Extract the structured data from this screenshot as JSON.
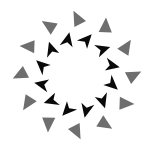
{
  "figure": {
    "background_color": "#ffffff",
    "width": 153,
    "height": 146,
    "center": {
      "x": 77,
      "y": 75
    },
    "frame": {
      "top_rule_color": "#8d8d8d",
      "bottom_rule_color": "#e2e2e2",
      "left_rule_color": "#b4b4b4",
      "right_rule_color": "#6f6f6f"
    }
  },
  "rings": [
    {
      "id": "outer-ring",
      "name": "outer ring of gray triangles",
      "element_count": 12,
      "element_shape": "triangle",
      "fill_color": "#6e6e6e",
      "radius": 57,
      "element_size": 13,
      "tilt_degrees": -28,
      "start_angle_degrees": -90,
      "elements": [
        {
          "index": 0,
          "angle": -90,
          "cx": 77,
          "cy": 18
        },
        {
          "index": 1,
          "angle": -60,
          "cx": 105.5,
          "cy": 25.5
        },
        {
          "index": 2,
          "angle": -30,
          "cx": 126.4,
          "cy": 46.5
        },
        {
          "index": 3,
          "angle": 0,
          "cx": 134,
          "cy": 75
        },
        {
          "index": 4,
          "angle": 30,
          "cx": 126.4,
          "cy": 103.5
        },
        {
          "index": 5,
          "angle": 60,
          "cx": 105.5,
          "cy": 124.4
        },
        {
          "index": 6,
          "angle": 90,
          "cx": 77,
          "cy": 132
        },
        {
          "index": 7,
          "angle": 120,
          "cx": 48.5,
          "cy": 124.4
        },
        {
          "index": 8,
          "angle": 150,
          "cx": 27.6,
          "cy": 103.5
        },
        {
          "index": 9,
          "angle": 180,
          "cx": 20,
          "cy": 75
        },
        {
          "index": 10,
          "angle": 210,
          "cx": 27.6,
          "cy": 46.5
        },
        {
          "index": 11,
          "angle": 240,
          "cx": 48.5,
          "cy": 25.5
        }
      ]
    },
    {
      "id": "inner-ring",
      "name": "inner ring of black notched arrow shapes",
      "element_count": 12,
      "element_shape": "notched-arrow",
      "fill_color": "#0a0a0a",
      "radius": 36,
      "element_size": 13,
      "tilt_degrees": 32,
      "start_angle_degrees": -75,
      "elements": [
        {
          "index": 0,
          "angle": -75,
          "cx": 86.3,
          "cy": 40.2
        },
        {
          "index": 1,
          "angle": -45,
          "cx": 102.5,
          "cy": 49.5
        },
        {
          "index": 2,
          "angle": -15,
          "cx": 111.8,
          "cy": 65.7
        },
        {
          "index": 3,
          "angle": 15,
          "cx": 111.8,
          "cy": 84.3
        },
        {
          "index": 4,
          "angle": 45,
          "cx": 102.5,
          "cy": 100.5
        },
        {
          "index": 5,
          "angle": 75,
          "cx": 86.3,
          "cy": 109.8
        },
        {
          "index": 6,
          "angle": 105,
          "cx": 67.7,
          "cy": 109.8
        },
        {
          "index": 7,
          "angle": 135,
          "cx": 51.5,
          "cy": 100.5
        },
        {
          "index": 8,
          "angle": 165,
          "cx": 42.2,
          "cy": 84.3
        },
        {
          "index": 9,
          "angle": 195,
          "cx": 42.2,
          "cy": 65.7
        },
        {
          "index": 10,
          "angle": 225,
          "cx": 51.5,
          "cy": 49.5
        },
        {
          "index": 11,
          "angle": 255,
          "cx": 67.7,
          "cy": 40.2
        }
      ]
    }
  ]
}
